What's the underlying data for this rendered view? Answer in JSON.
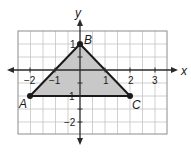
{
  "diagram": {
    "type": "coordinate-plane-triangle",
    "axes": {
      "x_label": "x",
      "y_label": "y",
      "x_ticks": [
        {
          "value": -2,
          "label": "−2"
        },
        {
          "value": -1,
          "label": "−1"
        },
        {
          "value": 1,
          "label": "1"
        },
        {
          "value": 2,
          "label": "2"
        },
        {
          "value": 3,
          "label": "3"
        }
      ],
      "y_ticks": [
        {
          "value": 1,
          "label": "1"
        },
        {
          "value": -1,
          "label": "1"
        },
        {
          "value": -2,
          "label": "−2"
        }
      ],
      "x_range": [
        -2,
        3
      ],
      "y_range": [
        -2,
        1
      ]
    },
    "triangle": {
      "fill_color": "#c8c8c8",
      "stroke_color": "#1a1a1a",
      "vertices": [
        {
          "name": "A",
          "x": -2,
          "y": -1
        },
        {
          "name": "B",
          "x": 0,
          "y": 1
        },
        {
          "name": "C",
          "x": 2,
          "y": -1
        }
      ]
    },
    "colors": {
      "grid": "#b5b5b5",
      "grid_border": "#8c8c8c",
      "axis": "#2a2a2a",
      "background": "#ffffff"
    }
  }
}
